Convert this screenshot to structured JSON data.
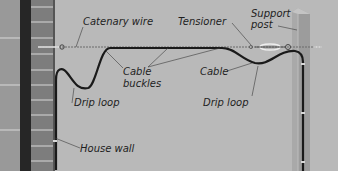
{
  "diagram": {
    "colors": {
      "background": "#b9b9b9",
      "wall_brick": "#8a8a8a",
      "wall_dark_stripe": "#2a2a2a",
      "post": "#a8a8a8",
      "cable": "#1a1a1a",
      "catenary_wire": "#6a6a6a",
      "leader_line": "#3a3a3a"
    },
    "labels": {
      "catenary_wire": "Catenary wire",
      "tensioner": "Tensioner",
      "support_post_line1": "Support",
      "support_post_line2": "post",
      "cable_buckles_line1": "Cable",
      "cable_buckles_line2": "buckles",
      "cable": "Cable",
      "drip_loop_left": "Drip loop",
      "drip_loop_right": "Drip loop",
      "house_wall": "House wall"
    },
    "components": [
      {
        "name": "House wall",
        "position": "left"
      },
      {
        "name": "Catenary wire",
        "position": "top horizontal span"
      },
      {
        "name": "Tensioner",
        "position": "near support post"
      },
      {
        "name": "Support post",
        "position": "right"
      },
      {
        "name": "Cable",
        "position": "hangs from catenary wire"
      },
      {
        "name": "Cable buckles",
        "position": "along catenary wire"
      },
      {
        "name": "Drip loop",
        "position": "both ends"
      }
    ]
  }
}
